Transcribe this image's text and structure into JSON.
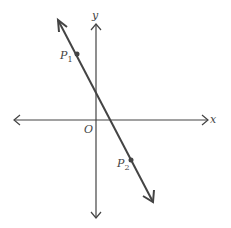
{
  "diagram": {
    "axes": {
      "x_label": "x",
      "y_label": "y",
      "origin_label": "O"
    },
    "points": [
      {
        "name": "P",
        "subscript": "1"
      },
      {
        "name": "P",
        "subscript": "2"
      }
    ],
    "line": {
      "description": "line through P1 and P2 with negative slope"
    },
    "colors": {
      "stroke": "#444444",
      "background": "#ffffff"
    }
  }
}
